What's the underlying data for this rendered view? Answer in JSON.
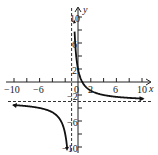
{
  "chart_data": {
    "type": "line",
    "title": "",
    "xlabel": "x",
    "ylabel": "y",
    "xlim": [
      -11,
      11
    ],
    "ylim": [
      -11,
      11
    ],
    "grid": false,
    "x_ticks": [
      -10,
      -8,
      -6,
      -4,
      -2,
      2,
      4,
      6,
      8,
      10
    ],
    "x_tick_labels": [
      "-10",
      "-6",
      "0",
      "2",
      "6",
      "10"
    ],
    "y_ticks": [
      -10,
      -8,
      -6,
      -4,
      -2,
      2,
      4,
      6,
      8,
      10
    ],
    "y_tick_labels": [
      "10",
      "6",
      "2",
      "-2",
      "-6",
      "-10"
    ],
    "function": "f(x) = 5/(x+1) - 3",
    "asymptotes": {
      "vertical": -1,
      "horizontal": -3
    },
    "series": [
      {
        "name": "right branch",
        "x": [
          -0.55,
          -0.5,
          -0.25,
          0,
          0.5,
          1,
          2,
          4,
          6,
          8,
          10
        ],
        "y": [
          8.1,
          7,
          1,
          2,
          0.33,
          -0.5,
          -1.33,
          -2,
          -2.29,
          -2.44,
          -2.55
        ]
      },
      {
        "name": "left branch",
        "x": [
          -10,
          -8,
          -6,
          -4,
          -3,
          -2,
          -1.7
        ],
        "y": [
          -3.56,
          -3.71,
          -4,
          -4.67,
          -5.5,
          -8,
          -10.1
        ]
      }
    ]
  },
  "labels": {
    "x_axis": "x",
    "y_axis": "y",
    "origin": "0",
    "xneg10": "−10",
    "xneg6": "−6",
    "x2": "2",
    "x6": "6",
    "x10": "10",
    "y10": "10",
    "y6": "6",
    "y2": "2",
    "yneg2": "−2",
    "yneg6": "−6",
    "yneg10": "−10"
  }
}
